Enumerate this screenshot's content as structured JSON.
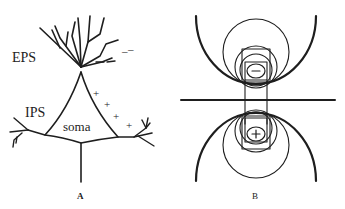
{
  "figure": {
    "panel_a": {
      "caption": "A",
      "labels": {
        "eps": "EPS",
        "ips": "IPS",
        "soma": "soma"
      },
      "charges": {
        "negative": [
          "–",
          "–",
          "–",
          "–"
        ],
        "positive": [
          "+",
          "+",
          "+",
          "+"
        ]
      }
    },
    "panel_b": {
      "caption": "B",
      "top_charge": "−",
      "bottom_charge": "+"
    },
    "colors": {
      "ink": "#1e1e1e",
      "background": "#ffffff"
    }
  }
}
